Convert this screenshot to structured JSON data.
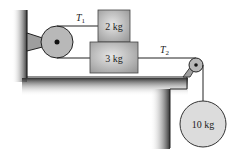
{
  "diagram": {
    "labels": {
      "tension_1": "T",
      "tension_1_sub": "1",
      "tension_2": "T",
      "tension_2_sub": "2"
    },
    "masses": {
      "upper_block": "2 kg",
      "lower_block": "3 kg",
      "hanging_ball": "10 kg"
    },
    "colors": {
      "pulley": "#b8b8b8",
      "block": "#c8c8c8",
      "ball": "#dcdcdc",
      "line": "#222222",
      "table_shadow": "#555555"
    }
  }
}
